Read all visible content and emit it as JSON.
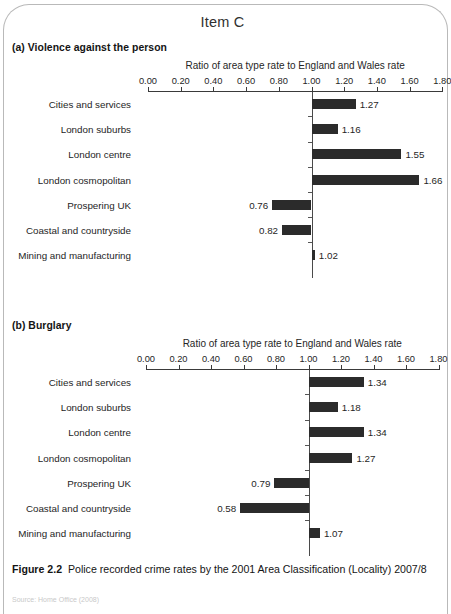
{
  "page": {
    "item_title": "Item C",
    "caption_label": "Figure 2.2",
    "caption_text": "Police recorded crime rates by the 2001 Area Classification (Locality) 2007/8",
    "source_partial": "Source: Home Office (2008)"
  },
  "charts": [
    {
      "id": "a",
      "heading": "(a) Violence against the person",
      "chart_data": {
        "type": "bar",
        "title": "(a) Violence against the person",
        "xlabel": "Ratio of area type rate to England and Wales rate",
        "ylabel": "",
        "orientation": "horizontal",
        "baseline": 1.0,
        "xlim": [
          0.0,
          1.8
        ],
        "xticks": [
          "0.00",
          "0.20",
          "0.40",
          "0.60",
          "0.80",
          "1.00",
          "1.20",
          "1.40",
          "1.60",
          "1.80"
        ],
        "grid": false,
        "legend": "none",
        "categories": [
          "Cities and services",
          "London suburbs",
          "London centre",
          "London cosmopolitan",
          "Prospering UK",
          "Coastal and countryside",
          "Mining and manufacturing"
        ],
        "values": [
          1.27,
          1.16,
          1.55,
          1.66,
          0.76,
          0.82,
          1.02
        ],
        "value_labels": [
          "1.27",
          "1.16",
          "1.55",
          "1.66",
          "0.76",
          "0.82",
          "1.02"
        ]
      }
    },
    {
      "id": "b",
      "heading": "(b) Burglary",
      "chart_data": {
        "type": "bar",
        "title": "(b) Burglary",
        "xlabel": "Ratio of area type rate to England and Wales rate",
        "ylabel": "",
        "orientation": "horizontal",
        "baseline": 1.0,
        "xlim": [
          0.0,
          1.8
        ],
        "xticks": [
          "0.00",
          "0.20",
          "0.40",
          "0.60",
          "0.80",
          "1.00",
          "1.20",
          "1.40",
          "1.60",
          "1.80"
        ],
        "grid": false,
        "legend": "none",
        "categories": [
          "Cities and services",
          "London suburbs",
          "London centre",
          "London cosmopolitan",
          "Prospering UK",
          "Coastal and countryside",
          "Mining and manufacturing"
        ],
        "values": [
          1.34,
          1.18,
          1.34,
          1.27,
          0.79,
          0.58,
          1.07
        ],
        "value_labels": [
          "1.34",
          "1.18",
          "1.34",
          "1.27",
          "0.79",
          "0.58",
          "1.07"
        ]
      }
    }
  ]
}
